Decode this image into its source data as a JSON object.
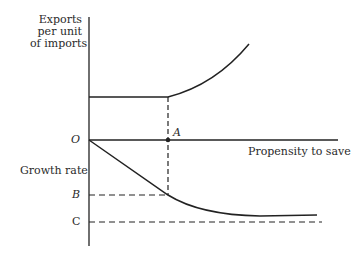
{
  "diagram": {
    "upper_axis_label": [
      "Exports",
      "per unit",
      "of imports"
    ],
    "lower_axis_label": "Growth rate",
    "x_axis_label": "Propensity to save",
    "origin_label": "O",
    "point_a_label": "A",
    "level_b_label": "B",
    "level_c_label": "C",
    "line_color": "#222222"
  }
}
